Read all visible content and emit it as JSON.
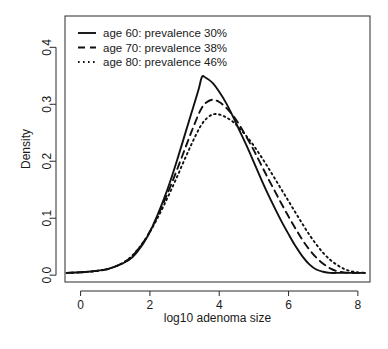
{
  "chart_data": {
    "type": "line",
    "title": "",
    "xlabel": "log10 adenoma size",
    "ylabel": "Density",
    "xlim": [
      -0.45,
      8.35
    ],
    "ylim": [
      -0.012,
      0.455
    ],
    "xticks": [
      0,
      2,
      4,
      6,
      8
    ],
    "xticklabels": [
      "0",
      "2",
      "4",
      "6",
      "8"
    ],
    "yticks": [
      0.0,
      0.1,
      0.2,
      0.3,
      0.4
    ],
    "yticklabels": [
      "0.0",
      "0.1",
      "0.2",
      "0.3",
      "0.4"
    ],
    "grid": false,
    "legend_position": "top-left",
    "x": [
      -0.4,
      0.0,
      0.4,
      0.8,
      1.2,
      1.5,
      1.8,
      2.0,
      2.2,
      2.4,
      2.6,
      2.8,
      3.0,
      3.2,
      3.4,
      3.5,
      3.6,
      3.8,
      4.0,
      4.2,
      4.4,
      4.6,
      4.8,
      5.0,
      5.2,
      5.4,
      5.6,
      5.8,
      6.0,
      6.2,
      6.4,
      6.6,
      6.8,
      7.0,
      7.2,
      7.4,
      7.6,
      7.8,
      8.0,
      8.2
    ],
    "series": [
      {
        "name": "age 60: prevalence 30%",
        "label": "age 60: prevalence 30%",
        "style": "solid",
        "peak_x": 3.5,
        "peak_y": 0.35,
        "values": [
          0.004,
          0.005,
          0.007,
          0.011,
          0.02,
          0.032,
          0.055,
          0.076,
          0.103,
          0.133,
          0.167,
          0.205,
          0.245,
          0.285,
          0.325,
          0.348,
          0.347,
          0.338,
          0.322,
          0.302,
          0.278,
          0.252,
          0.226,
          0.198,
          0.17,
          0.143,
          0.118,
          0.094,
          0.072,
          0.051,
          0.033,
          0.019,
          0.01,
          0.006,
          0.004,
          0.004,
          0.004,
          0.004,
          0.004,
          0.004
        ]
      },
      {
        "name": "age 70: prevalence 38%",
        "label": "age 70: prevalence 38%",
        "style": "dashed",
        "peak_x": 3.7,
        "peak_y": 0.308,
        "values": [
          0.004,
          0.005,
          0.007,
          0.011,
          0.021,
          0.034,
          0.057,
          0.077,
          0.101,
          0.128,
          0.157,
          0.188,
          0.22,
          0.252,
          0.282,
          0.294,
          0.302,
          0.308,
          0.304,
          0.294,
          0.28,
          0.262,
          0.241,
          0.219,
          0.195,
          0.171,
          0.148,
          0.125,
          0.103,
          0.082,
          0.062,
          0.045,
          0.031,
          0.02,
          0.012,
          0.007,
          0.005,
          0.004,
          0.004,
          0.004
        ]
      },
      {
        "name": "age 80: prevalence 46%",
        "label": "age 80: prevalence 46%",
        "style": "dotted",
        "peak_x": 3.75,
        "peak_y": 0.283,
        "values": [
          0.004,
          0.005,
          0.007,
          0.011,
          0.021,
          0.035,
          0.057,
          0.076,
          0.098,
          0.122,
          0.148,
          0.175,
          0.203,
          0.23,
          0.255,
          0.265,
          0.273,
          0.282,
          0.282,
          0.277,
          0.269,
          0.257,
          0.243,
          0.227,
          0.209,
          0.19,
          0.17,
          0.15,
          0.13,
          0.11,
          0.09,
          0.071,
          0.054,
          0.039,
          0.027,
          0.018,
          0.011,
          0.007,
          0.005,
          0.004
        ]
      }
    ]
  }
}
